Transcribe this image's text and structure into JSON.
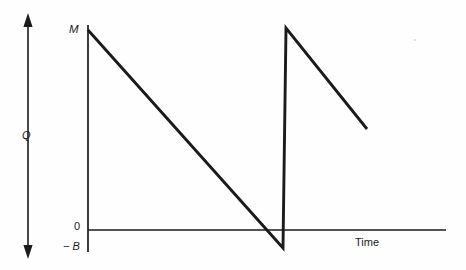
{
  "figure": {
    "title": "",
    "background_color": "#fefefe",
    "stroke_color": "#1b1b1b"
  },
  "labels": {
    "max_level": "M",
    "quantity_axis": "Q",
    "zero": "0",
    "min_level": "− B",
    "time_axis": "Time"
  },
  "icons": {
    "q_arrow": "double-headed-vertical-arrow-icon"
  },
  "chart_data": {
    "type": "line",
    "title": "",
    "xlabel": "Time",
    "ylabel": "Q",
    "grid": false,
    "legend": null,
    "annotations": [
      {
        "text": "M",
        "x": 0,
        "y": 1.0,
        "note": "maximum inventory level at y-axis"
      },
      {
        "text": "0",
        "x": 0,
        "y": 0.0,
        "note": "zero reference on vertical axis"
      },
      {
        "text": "− B",
        "x": 0,
        "y": -0.1,
        "note": "backorder / negative level"
      },
      {
        "text": "Time",
        "x": 0.79,
        "y": 0.0,
        "note": "horizontal axis label"
      }
    ],
    "axes": {
      "y_axis_x_px": 88,
      "x_axis_y_px": 230,
      "y_axis_top_px": 25,
      "y_axis_bottom_px": 252,
      "x_axis_right_px": 446,
      "y_ticks": [
        "M",
        "0",
        "− B"
      ],
      "ylim": [
        -0.1,
        1.0
      ],
      "xlim": [
        0,
        1
      ]
    },
    "series": [
      {
        "name": "inventory-level",
        "description": "Sawtooth inventory depletion with backorders; two cycles shown, second truncated",
        "points_px": [
          [
            88,
            30
          ],
          [
            283,
            248
          ],
          [
            286,
            28
          ],
          [
            367,
            129
          ]
        ],
        "points": [
          {
            "x": 0.0,
            "y": 1.0,
            "label": "M"
          },
          {
            "x": 0.545,
            "y": -0.1,
            "label": "− B"
          },
          {
            "x": 0.553,
            "y": 1.01,
            "label": "M"
          },
          {
            "x": 0.78,
            "y": 0.46,
            "label": ""
          }
        ]
      }
    ],
    "q_arrow": {
      "x_px": 28,
      "top_px": 14,
      "bottom_px": 258,
      "label": "Q",
      "double_headed": true
    }
  }
}
